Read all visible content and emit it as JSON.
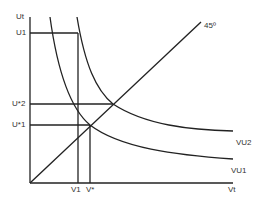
{
  "diagram": {
    "axes": {
      "y_label": "Ut",
      "x_label": "Vt"
    },
    "labels": {
      "u1": "U1",
      "u_star_2": "U*2",
      "u_star_1": "U*1",
      "v1": "V1",
      "v_star": "V*",
      "angle": "45º",
      "vu2": "VU2",
      "vu1": "VU1"
    },
    "colors": {
      "line": "#222222",
      "text": "#333333",
      "background": "#ffffff"
    }
  }
}
